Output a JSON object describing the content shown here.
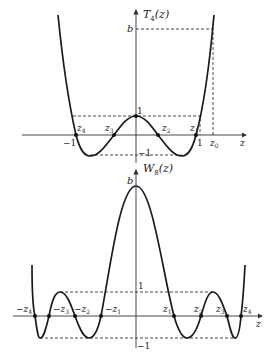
{
  "top_plot": {
    "ylabel": "T",
    "ylabel_sub": "4",
    "ylabel_arg": "(z)",
    "xlabel": "z",
    "b_label": "b",
    "one_label": "1",
    "minus_one_label": "−1",
    "x_minus_one_label": "−1",
    "x_one_label": "1",
    "z0_label": "z",
    "z0_sub": "0",
    "roots": [
      {
        "label": "z",
        "sub": "4"
      },
      {
        "label": "z",
        "sub": "3"
      },
      {
        "label": "z",
        "sub": "2"
      },
      {
        "label": "z",
        "sub": "1"
      }
    ]
  },
  "bottom_plot": {
    "ylabel": "W",
    "ylabel_sub": "8",
    "ylabel_arg": "(z)",
    "xlabel": "z",
    "b_label": "b",
    "one_label": "1",
    "minus_one_label": "−1",
    "roots": [
      {
        "label": "−z",
        "sub": "4"
      },
      {
        "label": "−z",
        "sub": "3"
      },
      {
        "label": "−z",
        "sub": "2"
      },
      {
        "label": "−z",
        "sub": "1"
      },
      {
        "label": "z",
        "sub": "1"
      },
      {
        "label": "z",
        "sub": "2"
      },
      {
        "label": "z",
        "sub": "3"
      },
      {
        "label": "z",
        "sub": "4"
      }
    ]
  }
}
